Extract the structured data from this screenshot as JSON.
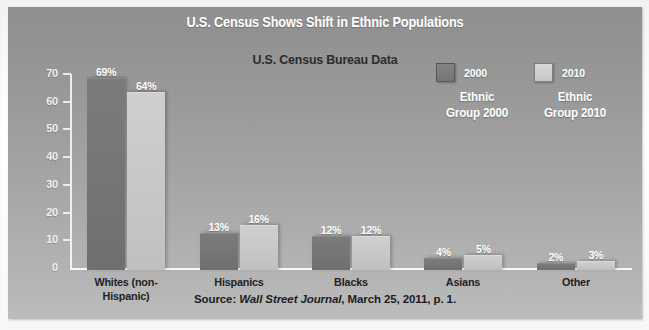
{
  "header": {
    "main_title": "U.S. Census Shows Shift in Ethnic Populations",
    "sub_title": "U.S. Census Bureau Data"
  },
  "legend": {
    "entries": [
      {
        "year": "2000",
        "name_line1": "Ethnic",
        "name_line2": "Group 2000",
        "color": "#757575"
      },
      {
        "year": "2010",
        "name_line1": "Ethnic",
        "name_line2": "Group 2010",
        "color": "#c7c7c7"
      }
    ]
  },
  "source": {
    "prefix": "Source: ",
    "journal": "Wall Street Journal",
    "suffix": ", March 25, 2011, p. 1."
  },
  "chart_data": {
    "type": "bar",
    "title": "U.S. Census Bureau Data",
    "xlabel": "",
    "ylabel": "",
    "ylim": [
      0,
      70
    ],
    "yticks": [
      0,
      10,
      20,
      30,
      40,
      50,
      60,
      70
    ],
    "ytick_labels": [
      "0",
      "10",
      "20",
      "30",
      "40",
      "50",
      "60",
      "70"
    ],
    "grid": false,
    "legend_position": "top-right",
    "categories": [
      "Whites (non-Hispanic)",
      "Hispanics",
      "Blacks",
      "Asians",
      "Other"
    ],
    "category_lines": [
      [
        "Whites (non-",
        "Hispanic)"
      ],
      [
        "Hispanics",
        ""
      ],
      [
        "Blacks",
        ""
      ],
      [
        "Asians",
        ""
      ],
      [
        "Other",
        ""
      ]
    ],
    "series": [
      {
        "name": "Ethnic Group 2000",
        "color": "#757575",
        "values": [
          69,
          13,
          12,
          4,
          2
        ],
        "labels": [
          "69%",
          "13%",
          "12%",
          "4%",
          "2%"
        ]
      },
      {
        "name": "Ethnic Group 2010",
        "color": "#c7c7c7",
        "values": [
          64,
          16,
          12,
          5,
          3
        ],
        "labels": [
          "64%",
          "16%",
          "12%",
          "5%",
          "3%"
        ]
      }
    ]
  }
}
